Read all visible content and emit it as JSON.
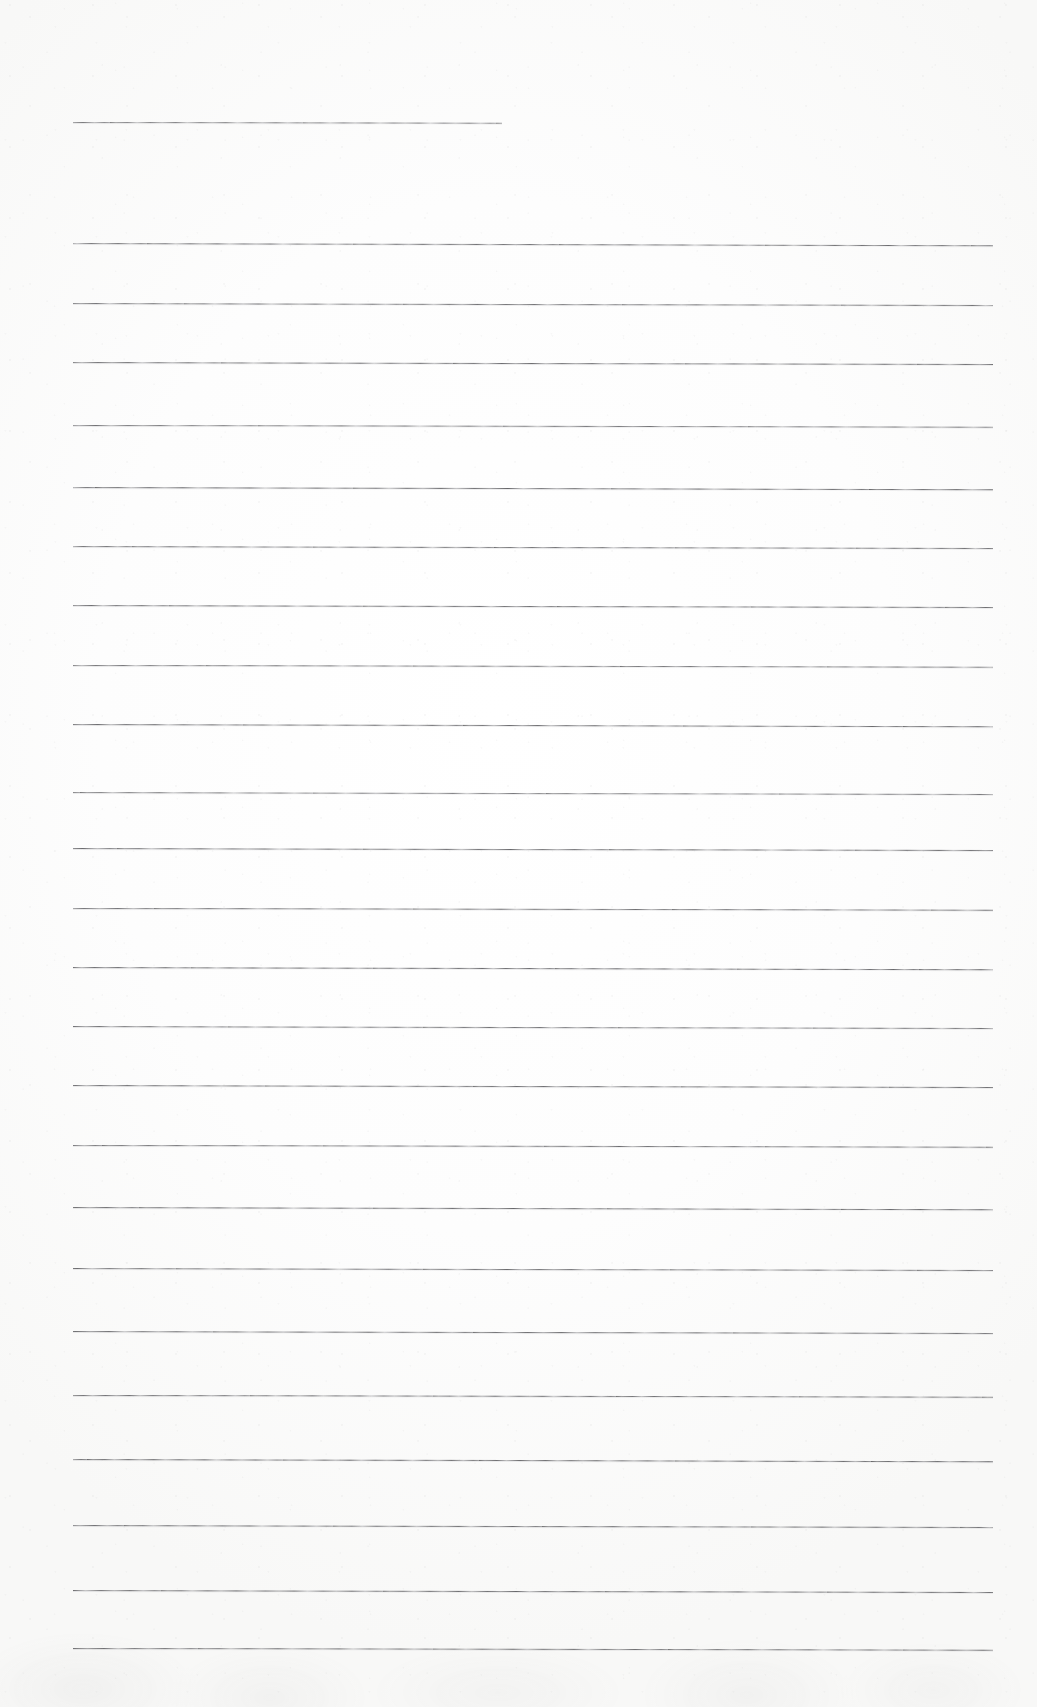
{
  "document": {
    "kind": "scanned-lined-paper",
    "page_width": 1037,
    "page_height": 1707,
    "paper_color": "#fdfdfd",
    "rule_color": "#4a4a4c",
    "text_content": "",
    "written_text_present": false,
    "line_count": 24
  },
  "ruling": {
    "left_x": 73,
    "right_x": 993,
    "average_spacing": 66,
    "first_line_is_partial": true,
    "first_line_right_x": 502,
    "lines": [
      {
        "index": 1,
        "y": 122,
        "x_start": 73,
        "x_end": 502,
        "skew_deg": 0.1,
        "weight": 0.78
      },
      {
        "index": 2,
        "y": 243,
        "x_start": 73,
        "x_end": 993,
        "skew_deg": 0.14,
        "weight": 0.86
      },
      {
        "index": 3,
        "y": 303,
        "x_start": 73,
        "x_end": 993,
        "skew_deg": 0.12,
        "weight": 0.84
      },
      {
        "index": 4,
        "y": 362,
        "x_start": 73,
        "x_end": 993,
        "skew_deg": 0.13,
        "weight": 0.88
      },
      {
        "index": 5,
        "y": 425,
        "x_start": 73,
        "x_end": 993,
        "skew_deg": 0.11,
        "weight": 0.82
      },
      {
        "index": 6,
        "y": 487,
        "x_start": 73,
        "x_end": 993,
        "skew_deg": 0.14,
        "weight": 0.9
      },
      {
        "index": 7,
        "y": 546,
        "x_start": 73,
        "x_end": 993,
        "skew_deg": 0.12,
        "weight": 0.85
      },
      {
        "index": 8,
        "y": 605,
        "x_start": 73,
        "x_end": 993,
        "skew_deg": 0.13,
        "weight": 0.87
      },
      {
        "index": 9,
        "y": 665,
        "x_start": 73,
        "x_end": 993,
        "skew_deg": 0.11,
        "weight": 0.83
      },
      {
        "index": 10,
        "y": 724,
        "x_start": 73,
        "x_end": 993,
        "skew_deg": 0.14,
        "weight": 0.89
      },
      {
        "index": 11,
        "y": 792,
        "x_start": 73,
        "x_end": 993,
        "skew_deg": 0.12,
        "weight": 0.8
      },
      {
        "index": 12,
        "y": 848,
        "x_start": 73,
        "x_end": 993,
        "skew_deg": 0.13,
        "weight": 0.88
      },
      {
        "index": 13,
        "y": 908,
        "x_start": 73,
        "x_end": 993,
        "skew_deg": 0.11,
        "weight": 0.86
      },
      {
        "index": 14,
        "y": 967,
        "x_start": 73,
        "x_end": 993,
        "skew_deg": 0.14,
        "weight": 0.9
      },
      {
        "index": 15,
        "y": 1026,
        "x_start": 73,
        "x_end": 993,
        "skew_deg": 0.12,
        "weight": 0.84
      },
      {
        "index": 16,
        "y": 1085,
        "x_start": 73,
        "x_end": 993,
        "skew_deg": 0.13,
        "weight": 0.87
      },
      {
        "index": 17,
        "y": 1145,
        "x_start": 73,
        "x_end": 993,
        "skew_deg": 0.11,
        "weight": 0.85
      },
      {
        "index": 18,
        "y": 1207,
        "x_start": 73,
        "x_end": 993,
        "skew_deg": 0.14,
        "weight": 0.89
      },
      {
        "index": 19,
        "y": 1268,
        "x_start": 73,
        "x_end": 993,
        "skew_deg": 0.12,
        "weight": 0.86
      },
      {
        "index": 20,
        "y": 1331,
        "x_start": 73,
        "x_end": 993,
        "skew_deg": 0.13,
        "weight": 0.88
      },
      {
        "index": 21,
        "y": 1395,
        "x_start": 73,
        "x_end": 993,
        "skew_deg": 0.11,
        "weight": 0.85
      },
      {
        "index": 22,
        "y": 1459,
        "x_start": 73,
        "x_end": 993,
        "skew_deg": 0.14,
        "weight": 0.9
      },
      {
        "index": 23,
        "y": 1525,
        "x_start": 73,
        "x_end": 993,
        "skew_deg": 0.12,
        "weight": 0.87
      },
      {
        "index": 24,
        "y": 1590,
        "x_start": 73,
        "x_end": 993,
        "skew_deg": 0.13,
        "weight": 0.89
      },
      {
        "index": 25,
        "y": 1648,
        "x_start": 73,
        "x_end": 993,
        "skew_deg": 0.11,
        "weight": 0.86
      }
    ]
  }
}
